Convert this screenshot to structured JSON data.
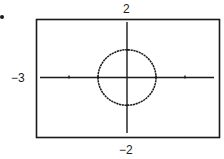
{
  "chart_data": {
    "type": "line",
    "title": "",
    "equation": "x^2 + y^2 = 1",
    "series": [
      {
        "name": "circle",
        "center": [
          0,
          0
        ],
        "radius": 1
      }
    ],
    "xlim": [
      -3,
      3
    ],
    "ylim": [
      -2,
      2
    ],
    "xscale": 1,
    "yscale": 1,
    "x_ticks": [
      -2,
      -1,
      1,
      2
    ],
    "y_ticks": [
      -1,
      1
    ],
    "window_labels": {
      "ymax": "2",
      "ymin": "−2",
      "xmin": "−3"
    },
    "xlabel": "",
    "ylabel": "",
    "grid": false,
    "legend": null
  },
  "labels": {
    "ymax": "2",
    "ymin": "−2",
    "xmin": "−3"
  },
  "colors": {
    "ink": "#1a1a1a",
    "background": "#ffffff"
  }
}
